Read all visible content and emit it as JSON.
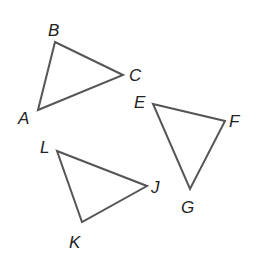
{
  "diagram": {
    "stroke_color": "#555555",
    "label_color": "#222222",
    "triangles": [
      {
        "name": "ABC",
        "vertices": [
          {
            "label": "A",
            "x": 38,
            "y": 110,
            "lx": 18,
            "ly": 124
          },
          {
            "label": "B",
            "x": 55,
            "y": 42,
            "lx": 48,
            "ly": 36
          },
          {
            "label": "C",
            "x": 123,
            "y": 75,
            "lx": 129,
            "ly": 81
          }
        ]
      },
      {
        "name": "EFG",
        "vertices": [
          {
            "label": "E",
            "x": 153,
            "y": 104,
            "lx": 134,
            "ly": 108
          },
          {
            "label": "F",
            "x": 225,
            "y": 121,
            "lx": 229,
            "ly": 127
          },
          {
            "label": "G",
            "x": 190,
            "y": 189,
            "lx": 181,
            "ly": 213
          }
        ]
      },
      {
        "name": "LJK",
        "vertices": [
          {
            "label": "L",
            "x": 57,
            "y": 151,
            "lx": 40,
            "ly": 153
          },
          {
            "label": "J",
            "x": 147,
            "y": 186,
            "lx": 151,
            "ly": 193
          },
          {
            "label": "K",
            "x": 82,
            "y": 222,
            "lx": 69,
            "ly": 248
          }
        ]
      }
    ]
  }
}
